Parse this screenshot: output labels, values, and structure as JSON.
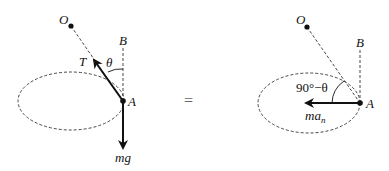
{
  "diagram": {
    "left_figure": {
      "labels": {
        "pivot": "O",
        "vertical_ref": "B",
        "point": "A",
        "tension": "T",
        "angle": "θ",
        "weight": "mg"
      }
    },
    "equals_sign": "=",
    "right_figure": {
      "labels": {
        "pivot": "O",
        "vertical_ref": "B",
        "point": "A",
        "angle": "90°−θ",
        "force_main": "ma",
        "force_sub": "n"
      }
    },
    "colors": {
      "line": "#111111",
      "dashed": "#333333",
      "background": "#ffffff"
    }
  }
}
